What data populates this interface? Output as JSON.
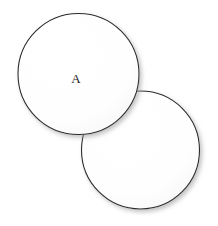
{
  "figure": {
    "background_color": "#ffffff",
    "width": 218,
    "height": 226
  },
  "style": {
    "stroke_color": "#2b2b2b",
    "fill_color": "#fefefe",
    "stroke_width": 1.1,
    "shadow_color": "#b9b9b9",
    "label_color": "#1a1a1a"
  },
  "chart_data": {
    "type": "diagram",
    "shapes": [
      {
        "id": "circle-a",
        "kind": "circle",
        "label": "A",
        "cx": 78.5,
        "cy": 74,
        "r": 60.5,
        "fill": "#fefefe",
        "stroke": "#2b2b2b"
      },
      {
        "id": "circle-b",
        "kind": "circle",
        "label": "",
        "cx": 140.5,
        "cy": 150,
        "r": 59,
        "fill": "#fefefe",
        "stroke": "#2b2b2b"
      }
    ],
    "labels": [
      {
        "text": "A",
        "x": 76,
        "y": 80,
        "shape": "circle-a"
      }
    ],
    "annotations": [],
    "legend": []
  }
}
